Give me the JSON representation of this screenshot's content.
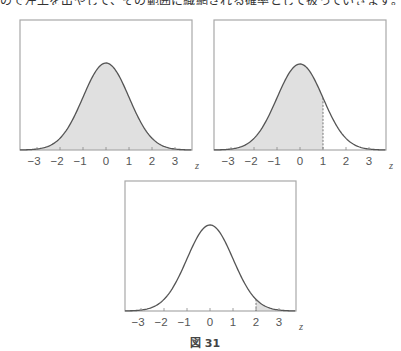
{
  "header": {
    "text_fragment": "ので左上を出やして、その範囲に織網される確率として扱っていきます。"
  },
  "figure": {
    "caption": "図 31"
  },
  "chart_data": [
    {
      "type": "area",
      "title": "",
      "xlabel": "z",
      "ylabel": "",
      "distribution": "standard normal",
      "x_ticks": [
        -3,
        -2,
        -1,
        0,
        1,
        2,
        3
      ],
      "tick_labels": [
        "−3",
        "−2",
        "−1",
        "0",
        "1",
        "2",
        "3"
      ],
      "xlim": [
        -3.7,
        3.7
      ],
      "shaded_region": {
        "from": "-inf",
        "to": "inf"
      },
      "grid": false,
      "position": "top-left"
    },
    {
      "type": "area",
      "title": "",
      "xlabel": "z",
      "ylabel": "",
      "distribution": "standard normal",
      "x_ticks": [
        -3,
        -2,
        -1,
        0,
        1,
        2,
        3
      ],
      "tick_labels": [
        "−3",
        "−2",
        "−1",
        "0",
        "1",
        "2",
        "3"
      ],
      "xlim": [
        -3.7,
        3.7
      ],
      "shaded_region": {
        "from": "-inf",
        "to": 1
      },
      "boundary_line": 1,
      "grid": false,
      "position": "top-right"
    },
    {
      "type": "area",
      "title": "",
      "xlabel": "z",
      "ylabel": "",
      "distribution": "standard normal",
      "x_ticks": [
        -3,
        -2,
        -1,
        0,
        1,
        2,
        3
      ],
      "tick_labels": [
        "−3",
        "−2",
        "−1",
        "0",
        "1",
        "2",
        "3"
      ],
      "xlim": [
        -3.7,
        3.7
      ],
      "shaded_region": {
        "from": 2,
        "to": "inf"
      },
      "boundary_line": 2,
      "grid": false,
      "position": "bottom-center"
    }
  ],
  "charts": [
    {
      "left": 20,
      "top": 20,
      "right": 192,
      "base": 150,
      "peak": 63,
      "zero": 106,
      "unit": 23,
      "shade_from": -3.75,
      "shade_to": 3.75,
      "line": null
    },
    {
      "left": 214,
      "top": 20,
      "right": 386,
      "base": 150,
      "peak": 64,
      "zero": 300,
      "unit": 23,
      "shade_from": -3.75,
      "shade_to": 1,
      "line": 1
    },
    {
      "left": 125,
      "top": 181,
      "right": 296,
      "base": 311,
      "peak": 225,
      "zero": 210,
      "unit": 23,
      "shade_from": 2,
      "shade_to": 3.75,
      "line": 2
    }
  ],
  "tick_labels": [
    "−3",
    "−2",
    "−1",
    "0",
    "1",
    "2",
    "3"
  ],
  "axis_label": "z"
}
